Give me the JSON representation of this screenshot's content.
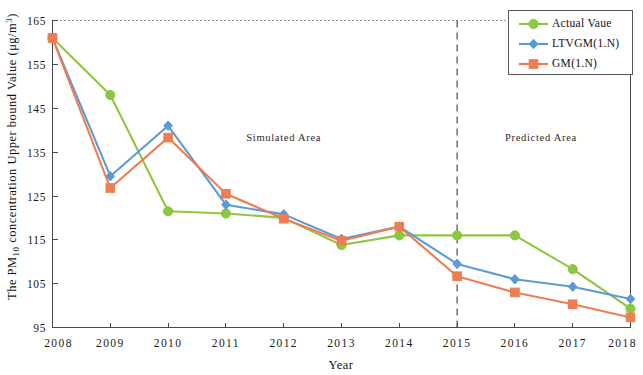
{
  "chart_data": {
    "type": "line",
    "title": "",
    "xlabel": "Year",
    "ylabel": "The PM10 concentration Upper bound Value (μg/m3)",
    "ylabel_prefix": "The PM",
    "ylabel_sub": "10",
    "ylabel_mid": " concentration Upper bound Value (μg/m",
    "ylabel_sup": "3",
    "ylabel_suffix": ")",
    "x": [
      2008,
      2009,
      2010,
      2011,
      2012,
      2013,
      2014,
      2015,
      2016,
      2017,
      2018
    ],
    "categories": [
      "2008",
      "2009",
      "2010",
      "2011",
      "2012",
      "2013",
      "2014",
      "2015",
      "2016",
      "2017",
      "2018"
    ],
    "xlim": [
      2008,
      2018
    ],
    "ylim": [
      95,
      165
    ],
    "yticks": [
      95,
      105,
      115,
      125,
      135,
      145,
      155,
      165
    ],
    "ytick_labels": [
      "95",
      "105",
      "115",
      "125",
      "135",
      "145",
      "155",
      "165"
    ],
    "grid": false,
    "legend_position": "top-right",
    "series": [
      {
        "name": "Actual Vaue",
        "color": "#8DC63F",
        "marker": "circle",
        "values": [
          161.0,
          148.0,
          121.5,
          121.0,
          120.0,
          113.8,
          116.0,
          116.0,
          116.0,
          108.3,
          99.3
        ]
      },
      {
        "name": "LTVGM(1.N)",
        "color": "#5B9BD5",
        "marker": "diamond",
        "values": [
          161.0,
          129.5,
          141.0,
          123.0,
          120.8,
          115.2,
          118.0,
          109.5,
          106.0,
          104.3,
          101.5
        ]
      },
      {
        "name": "GM(1.N)",
        "color": "#ED7D53",
        "marker": "square",
        "values": [
          161.0,
          126.8,
          138.3,
          125.5,
          119.8,
          114.8,
          118.0,
          106.7,
          103.0,
          100.3,
          97.3
        ]
      }
    ],
    "annotations": [
      {
        "text": "Simulated  Area",
        "x": 2012,
        "y": 137.5
      },
      {
        "text": "Predicted  Area",
        "x": 2016.45,
        "y": 137.5
      }
    ],
    "divider": {
      "x": 2015,
      "label": "simulated-predicted-divider"
    }
  }
}
